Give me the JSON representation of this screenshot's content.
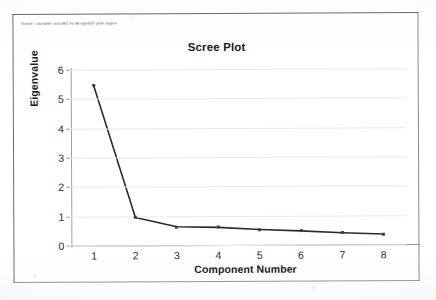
{
  "window": {
    "command_line": "factor: variable vocab1 to designb2/ plot eigen."
  },
  "chart_data": {
    "type": "line",
    "title": "Scree Plot",
    "xlabel": "Component Number",
    "ylabel": "Eigenvalue",
    "categories": [
      1,
      2,
      3,
      4,
      5,
      6,
      7,
      8
    ],
    "values": [
      5.47,
      0.95,
      0.63,
      0.6,
      0.52,
      0.47,
      0.4,
      0.35
    ],
    "x_tick_labels": [
      "1",
      "2",
      "3",
      "4",
      "5",
      "6",
      "7",
      "8"
    ],
    "y_tick_labels": [
      "0",
      "1",
      "2",
      "3",
      "4",
      "5",
      "6"
    ],
    "xlim": [
      0.45,
      8.55
    ],
    "ylim": [
      0,
      6
    ],
    "grid": true,
    "legend": false,
    "line_color": "#2b2b2b",
    "marker_color": "#3f3f3f",
    "grid_color": "#e9e9e9"
  }
}
